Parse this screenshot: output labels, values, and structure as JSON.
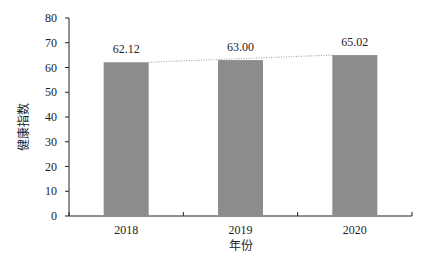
{
  "chart_data": {
    "type": "bar",
    "title": "",
    "xlabel": "年份",
    "ylabel": "健康指数",
    "categories": [
      "2018",
      "2019",
      "2020"
    ],
    "values": [
      62.12,
      63.0,
      65.02
    ],
    "data_labels": [
      "62.12",
      "63.00",
      "65.02"
    ],
    "ylim": [
      0,
      80
    ],
    "yticks": [
      0,
      10,
      20,
      30,
      40,
      50,
      60,
      70,
      80
    ],
    "trendline": "dotted linear",
    "grid": false,
    "legend": "none",
    "bar_color": "#8c8c8c"
  }
}
